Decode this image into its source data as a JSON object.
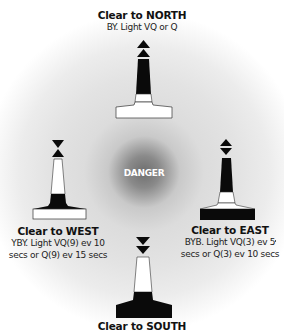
{
  "center": {
    "label": "DANGER"
  },
  "buoys": {
    "north": {
      "title": "Clear to NORTH",
      "desc": "BY. Light VQ or Q",
      "colors": "black-over-yellow",
      "topmark": "two cones pointing up"
    },
    "west": {
      "title": "Clear to WEST",
      "desc_line1": "YBY. Light VQ(9) ev 10",
      "desc_line2": "secs or Q(9) ev 15 secs",
      "colors": "yellow-black-yellow",
      "topmark": "two cones point to point"
    },
    "east": {
      "title": "Clear to EAST",
      "desc_line1": "BYB. Light VQ(3) ev 5",
      "desc_line2": "secs or Q(3) ev 10 secs",
      "colors": "black-yellow-black",
      "topmark": "two cones base to base"
    },
    "south": {
      "title": "Clear to SOUTH",
      "colors": "yellow-over-black",
      "topmark": "two cones pointing down"
    }
  },
  "colors": {
    "black": "#0a0a0a",
    "white": "#ffffff",
    "outline": "#333333",
    "halo_center": "#6e6e6e"
  }
}
